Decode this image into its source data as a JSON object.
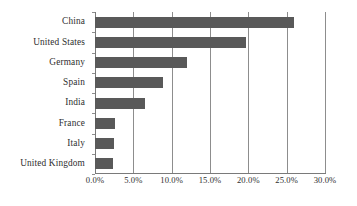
{
  "chart_data": {
    "type": "bar",
    "orientation": "horizontal",
    "title": "",
    "subtitle": "",
    "xlabel": "",
    "ylabel": "",
    "categories": [
      "China",
      "United States",
      "Germany",
      "Spain",
      "India",
      "France",
      "Italy",
      "United Kingdom"
    ],
    "values": [
      26.0,
      19.7,
      12.0,
      8.9,
      6.5,
      2.6,
      2.5,
      2.4
    ],
    "value_unit": "%",
    "xlim": [
      0.0,
      30.0
    ],
    "xticks": [
      0.0,
      5.0,
      10.0,
      15.0,
      20.0,
      25.0,
      30.0
    ],
    "xtick_labels": [
      "0.0%",
      "5.0%",
      "10.0%",
      "15.0%",
      "20.0%",
      "25.0%",
      "30.0%"
    ],
    "grid": "vertical",
    "legend": "none",
    "series": [
      {
        "name": "Share",
        "values": [
          26.0,
          19.7,
          12.0,
          8.9,
          6.5,
          2.6,
          2.5,
          2.4
        ]
      }
    ],
    "annotations": []
  },
  "style": {
    "bar_color": "#595959",
    "gridline_color": "#8d8d8d",
    "axis_color": "#7a7a7a",
    "text_color": "#2e2e2e",
    "background": "#ffffff"
  }
}
